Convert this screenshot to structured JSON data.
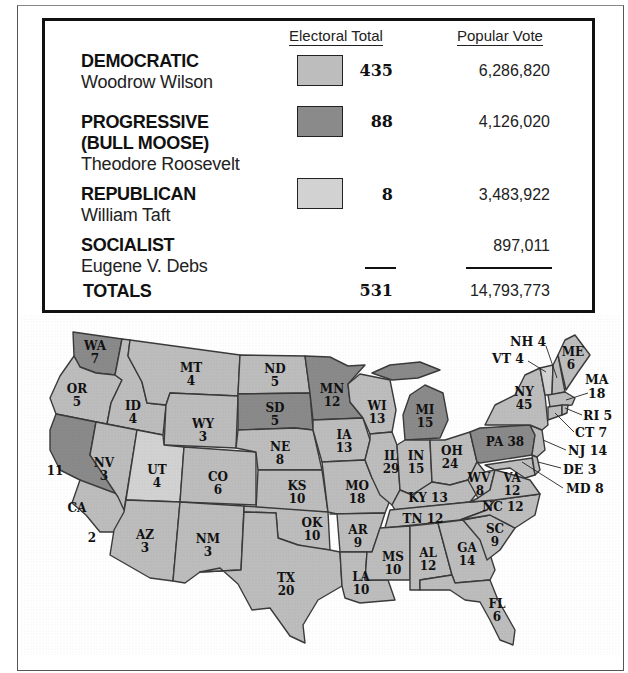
{
  "legend": {
    "headers": {
      "electoral": "Electoral Total",
      "popular": "Popular Vote"
    },
    "rows": [
      {
        "party": "DEMOCRATIC",
        "party_line2": "",
        "candidate": "Woodrow Wilson",
        "electoral": "435",
        "popular": "6,286,820",
        "swatch_color": "#bdbdbd"
      },
      {
        "party": "PROGRESSIVE",
        "party_line2": "(BULL MOOSE)",
        "candidate": "Theodore Roosevelt",
        "electoral": "88",
        "popular": "4,126,020",
        "swatch_color": "#8a8a8a"
      },
      {
        "party": "REPUBLICAN",
        "party_line2": "",
        "candidate": "William Taft",
        "electoral": "8",
        "popular": "3,483,922",
        "swatch_color": "#d2d2d2"
      },
      {
        "party": "SOCIALIST",
        "party_line2": "",
        "candidate": "Eugene V. Debs",
        "electoral": "",
        "popular": "897,011",
        "swatch_color": ""
      }
    ],
    "totals": {
      "label": "TOTALS",
      "electoral": "531",
      "popular": "14,793,773"
    }
  },
  "colors": {
    "democratic": "#bdbdbd",
    "progressive": "#8a8a8a",
    "republican": "#d2d2d2",
    "border": "#3a3a3a",
    "water": "#ffffff"
  },
  "map": {
    "states": [
      {
        "abbr": "WA",
        "votes": "7",
        "party": "progressive"
      },
      {
        "abbr": "OR",
        "votes": "5",
        "party": "democratic"
      },
      {
        "abbr": "CA",
        "votes": "11",
        "party": "progressive"
      },
      {
        "abbr": "CA",
        "votes": "2",
        "party": "democratic"
      },
      {
        "abbr": "ID",
        "votes": "4",
        "party": "democratic"
      },
      {
        "abbr": "NV",
        "votes": "3",
        "party": "democratic"
      },
      {
        "abbr": "MT",
        "votes": "4",
        "party": "democratic"
      },
      {
        "abbr": "WY",
        "votes": "3",
        "party": "democratic"
      },
      {
        "abbr": "UT",
        "votes": "4",
        "party": "republican"
      },
      {
        "abbr": "CO",
        "votes": "6",
        "party": "democratic"
      },
      {
        "abbr": "AZ",
        "votes": "3",
        "party": "democratic"
      },
      {
        "abbr": "NM",
        "votes": "3",
        "party": "democratic"
      },
      {
        "abbr": "ND",
        "votes": "5",
        "party": "democratic"
      },
      {
        "abbr": "SD",
        "votes": "5",
        "party": "progressive"
      },
      {
        "abbr": "NE",
        "votes": "8",
        "party": "democratic"
      },
      {
        "abbr": "KS",
        "votes": "10",
        "party": "democratic"
      },
      {
        "abbr": "OK",
        "votes": "10",
        "party": "democratic"
      },
      {
        "abbr": "TX",
        "votes": "20",
        "party": "democratic"
      },
      {
        "abbr": "MN",
        "votes": "12",
        "party": "progressive"
      },
      {
        "abbr": "IA",
        "votes": "13",
        "party": "democratic"
      },
      {
        "abbr": "MO",
        "votes": "18",
        "party": "democratic"
      },
      {
        "abbr": "AR",
        "votes": "9",
        "party": "democratic"
      },
      {
        "abbr": "LA",
        "votes": "10",
        "party": "democratic"
      },
      {
        "abbr": "WI",
        "votes": "13",
        "party": "democratic"
      },
      {
        "abbr": "IL",
        "votes": "29",
        "party": "democratic"
      },
      {
        "abbr": "MI",
        "votes": "15",
        "party": "progressive"
      },
      {
        "abbr": "IN",
        "votes": "15",
        "party": "democratic"
      },
      {
        "abbr": "OH",
        "votes": "24",
        "party": "democratic"
      },
      {
        "abbr": "KY",
        "votes": "13",
        "party": "democratic"
      },
      {
        "abbr": "TN",
        "votes": "12",
        "party": "democratic"
      },
      {
        "abbr": "MS",
        "votes": "10",
        "party": "democratic"
      },
      {
        "abbr": "AL",
        "votes": "12",
        "party": "democratic"
      },
      {
        "abbr": "GA",
        "votes": "14",
        "party": "democratic"
      },
      {
        "abbr": "FL",
        "votes": "6",
        "party": "democratic"
      },
      {
        "abbr": "SC",
        "votes": "9",
        "party": "democratic"
      },
      {
        "abbr": "NC",
        "votes": "12",
        "party": "democratic"
      },
      {
        "abbr": "VA",
        "votes": "12",
        "party": "democratic"
      },
      {
        "abbr": "WV",
        "votes": "8",
        "party": "democratic"
      },
      {
        "abbr": "PA",
        "votes": "38",
        "party": "progressive"
      },
      {
        "abbr": "NY",
        "votes": "45",
        "party": "democratic"
      },
      {
        "abbr": "VT",
        "votes": "4",
        "party": "republican"
      },
      {
        "abbr": "NH",
        "votes": "4",
        "party": "democratic"
      },
      {
        "abbr": "ME",
        "votes": "6",
        "party": "democratic"
      },
      {
        "abbr": "MA",
        "votes": "18",
        "party": "democratic"
      },
      {
        "abbr": "RI",
        "votes": "5",
        "party": "democratic"
      },
      {
        "abbr": "CT",
        "votes": "7",
        "party": "democratic"
      },
      {
        "abbr": "NJ",
        "votes": "14",
        "party": "democratic"
      },
      {
        "abbr": "DE",
        "votes": "3",
        "party": "democratic"
      },
      {
        "abbr": "MD",
        "votes": "8",
        "party": "democratic"
      }
    ],
    "callouts": {
      "NH": "NH 4",
      "VT": "VT 4",
      "MA_abbr": "MA",
      "MA_votes": "18",
      "RI": "RI 5",
      "CT": "CT 7",
      "NJ": "NJ 14",
      "DE": "DE 3",
      "MD": "MD 8",
      "PA": "PA 38",
      "KY": "KY 13",
      "TN": "TN 12",
      "NC": "NC 12",
      "CA": "CA"
    }
  }
}
